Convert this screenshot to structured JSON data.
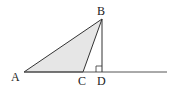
{
  "diagram": {
    "type": "geometry",
    "points": {
      "A": {
        "label": "A",
        "x": 24,
        "y": 72
      },
      "B": {
        "label": "B",
        "x": 102,
        "y": 19
      },
      "C": {
        "label": "C",
        "x": 83,
        "y": 72
      },
      "D": {
        "label": "D",
        "x": 102,
        "y": 72
      }
    },
    "labels": {
      "A": "A",
      "B": "B",
      "C": "C",
      "D": "D"
    },
    "base_line": {
      "x1": 24,
      "y1": 72,
      "x2": 167,
      "y2": 72
    },
    "right_angle_marker": {
      "at": "D",
      "size": 6
    },
    "colors": {
      "fill": "#e6e6e6",
      "stroke": "#333333",
      "line": "#555555"
    }
  }
}
